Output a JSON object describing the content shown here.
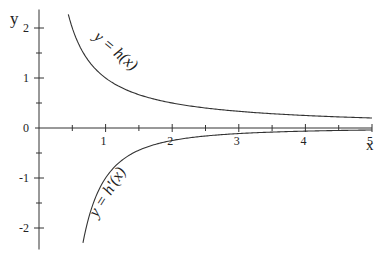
{
  "chart_data": {
    "type": "line",
    "title": "",
    "xlabel": "x",
    "ylabel": "y",
    "xlim": [
      0,
      5
    ],
    "ylim": [
      -2.35,
      2.35
    ],
    "grid": false,
    "legend": null,
    "x_ticks": [
      1,
      2,
      3,
      4,
      5
    ],
    "x_tick_labels": [
      "1",
      "2",
      "3",
      "4",
      "5"
    ],
    "x_minor_step": 0.5,
    "y_ticks": [
      -2,
      -1,
      0,
      1,
      2
    ],
    "y_tick_labels": [
      "-2",
      "-1",
      "0",
      "1",
      "2"
    ],
    "y_minor_step": 0.5,
    "series": [
      {
        "name": "y = h(x)",
        "label": "y = h(x)",
        "formula": "1/x",
        "x": [
          0.44,
          0.5,
          0.6,
          0.75,
          1.0,
          1.25,
          1.5,
          2.0,
          2.5,
          3.0,
          3.5,
          4.0,
          4.5,
          5.0
        ],
        "values": [
          2.27,
          2.0,
          1.67,
          1.33,
          1.0,
          0.8,
          0.67,
          0.5,
          0.4,
          0.33,
          0.29,
          0.25,
          0.22,
          0.2
        ]
      },
      {
        "name": "y = h'(x)",
        "label": "y = h'(x)",
        "formula": "-1/x^2",
        "x": [
          0.66,
          0.75,
          0.85,
          1.0,
          1.25,
          1.5,
          2.0,
          2.5,
          3.0,
          3.5,
          4.0,
          4.5,
          5.0
        ],
        "values": [
          -2.3,
          -1.78,
          -1.38,
          -1.0,
          -0.64,
          -0.44,
          -0.25,
          -0.16,
          -0.11,
          -0.08,
          -0.06,
          -0.05,
          -0.04
        ]
      }
    ],
    "annotations": [
      {
        "text": "y = h(x)",
        "near_x": 1.0,
        "near_y": 1.2
      },
      {
        "text": "y = h'(x)",
        "near_x": 1.1,
        "near_y": -1.3
      }
    ]
  }
}
